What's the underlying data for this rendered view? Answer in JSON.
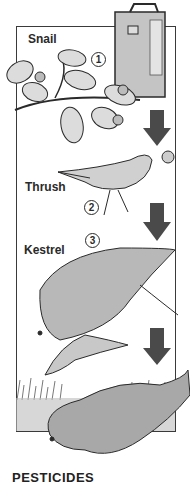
{
  "diagram": {
    "title": "PESTICIDES",
    "stages": [
      {
        "number": "1",
        "label": "Snail"
      },
      {
        "number": "2",
        "label": "Thrush"
      },
      {
        "number": "3",
        "label": "Kestrel"
      }
    ],
    "colors": {
      "arrow": "#4a4a4a",
      "outline": "#2a2a2a",
      "fill_light": "#d8d8d8",
      "fill_mid": "#a8a8a8",
      "background": "#ffffff"
    }
  }
}
